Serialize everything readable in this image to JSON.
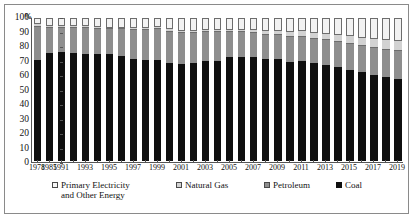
{
  "chart_data": {
    "type": "bar",
    "stacked": true,
    "title": "",
    "xlabel": "",
    "ylabel": "",
    "ylim": [
      0,
      100
    ],
    "yticks": [
      0,
      10,
      20,
      30,
      40,
      50,
      60,
      70,
      80,
      90,
      100
    ],
    "y_unit": "%",
    "grid": false,
    "legend_position": "bottom",
    "categories": [
      "1978",
      "1985",
      "1991",
      "1992",
      "1993",
      "1994",
      "1995",
      "1996",
      "1997",
      "1998",
      "1999",
      "2000",
      "2001",
      "2002",
      "2003",
      "2004",
      "2005",
      "2006",
      "2007",
      "2008",
      "2009",
      "2010",
      "2011",
      "2012",
      "2013",
      "2014",
      "2015",
      "2016",
      "2017",
      "2018",
      "2019"
    ],
    "tick_labels": [
      "1978",
      "1985",
      "1991",
      "",
      "1993",
      "",
      "1995",
      "",
      "1997",
      "",
      "1999",
      "",
      "2001",
      "",
      "2003",
      "",
      "2005",
      "",
      "2007",
      "",
      "2009",
      "",
      "2011",
      "",
      "2013",
      "",
      "2015",
      "",
      "2017",
      "",
      "2019"
    ],
    "series": [
      {
        "name": "Coal",
        "color": "#0f0f0f",
        "values": [
          70.7,
          75.8,
          76.1,
          75.7,
          74.7,
          75.0,
          74.6,
          73.5,
          71.4,
          70.9,
          70.6,
          68.5,
          68.0,
          68.5,
          70.2,
          70.2,
          72.4,
          72.4,
          72.5,
          71.5,
          71.6,
          69.2,
          70.2,
          68.5,
          67.4,
          65.8,
          63.7,
          62.0,
          60.4,
          59.0,
          57.7
        ]
      },
      {
        "name": "Petroleum",
        "color": "#8e8e8e",
        "values": [
          22.7,
          17.1,
          17.1,
          17.5,
          18.2,
          17.4,
          17.5,
          18.7,
          20.4,
          20.8,
          21.5,
          22.0,
          21.2,
          21.0,
          20.1,
          19.9,
          17.8,
          17.5,
          17.0,
          16.7,
          16.4,
          17.4,
          16.8,
          17.0,
          17.1,
          17.3,
          18.3,
          18.3,
          18.8,
          18.9,
          18.9
        ]
      },
      {
        "name": "Natural Gas",
        "color": "#d2d2d2",
        "values": [
          3.2,
          2.2,
          2.0,
          1.9,
          1.9,
          1.9,
          1.8,
          1.8,
          1.7,
          1.8,
          2.0,
          2.2,
          2.4,
          2.3,
          2.3,
          2.3,
          2.4,
          2.7,
          3.0,
          3.4,
          3.5,
          4.0,
          4.6,
          4.8,
          5.3,
          5.6,
          5.9,
          6.2,
          7.0,
          7.6,
          8.1
        ]
      },
      {
        "name": "Primary Electricity and Other Energy",
        "color": "#f2f2f2",
        "values": [
          3.4,
          4.9,
          4.8,
          4.9,
          5.2,
          5.7,
          6.1,
          6.0,
          6.5,
          6.5,
          5.9,
          7.3,
          8.4,
          8.2,
          7.4,
          7.6,
          7.4,
          7.4,
          7.5,
          8.4,
          8.5,
          9.4,
          8.4,
          9.7,
          10.2,
          11.3,
          12.1,
          13.5,
          13.8,
          14.5,
          15.3
        ]
      }
    ]
  },
  "legend": {
    "items": [
      {
        "label": "Primary Electricity\nand Other Energy",
        "swatch": "sw-primary",
        "name": "legend-primary-electricity"
      },
      {
        "label": "Natural Gas",
        "swatch": "sw-gas",
        "name": "legend-natural-gas"
      },
      {
        "label": "Petroleum",
        "swatch": "sw-petroleum",
        "name": "legend-petroleum"
      },
      {
        "label": "Coal",
        "swatch": "sw-coal",
        "name": "legend-coal"
      }
    ]
  },
  "axis": {
    "percent_symbol": "%"
  }
}
